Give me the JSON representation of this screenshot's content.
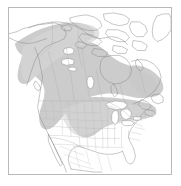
{
  "figure": {
    "type": "range-map",
    "title": "North America species distribution map",
    "region": "North America",
    "projection_hint": "conic",
    "frame": {
      "visible": true,
      "border_color": "#b9b9b9",
      "background_color": "#ffffff",
      "left": 8,
      "top": 7,
      "width": 164,
      "height": 168
    }
  },
  "legend": {
    "visible": false,
    "entries": [
      {
        "label": "Range",
        "color": "#c9c9c9"
      }
    ]
  },
  "labels": {
    "visible": false,
    "items": []
  },
  "colors": {
    "range_fill": "#c9c9c9",
    "range_fill_soft": "#d6d6d6",
    "land_fill": "#ffffff",
    "coastline": "#808080",
    "political_boundary": "#b0b0b0",
    "state_boundary": "#bcbcbc",
    "lake_fill": "#ffffff",
    "lake_outline": "#888888",
    "frame": "#b9b9b9",
    "background": "#ffffff"
  },
  "map_features": {
    "land_masses": [
      "continental-north-america",
      "alaska",
      "canadian-arctic-archipelago",
      "greenland-edge",
      "newfoundland",
      "vancouver-island",
      "baja-california"
    ],
    "water_bodies": [
      "hudson-bay",
      "great-lakes",
      "great-slave-lake",
      "great-bear-lake",
      "lake-winnipeg",
      "gulf-of-mexico",
      "pacific-ocean",
      "atlantic-ocean"
    ],
    "boundaries": [
      "usa-canada-border",
      "usa-mexico-border",
      "us-state-lines",
      "canadian-province-lines"
    ]
  },
  "range_polygon": {
    "name": "shaded-distribution-range",
    "fill": "#c9c9c9",
    "opacity": 0.95,
    "coverage_notes": "Southeast Alaska panhandle, British Columbia, Yukon, boreal western and central Canada, Great Lakes, upper Midwest and northeastern United States"
  }
}
